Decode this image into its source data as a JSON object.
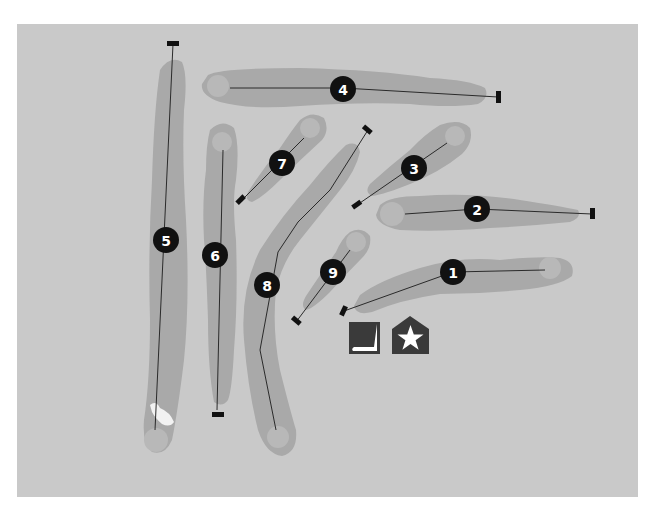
{
  "map": {
    "title": "Golf course layout",
    "colors": {
      "background": "#c9c9c9",
      "fairway": "#a9a9a9",
      "green": "#b8b8b8",
      "marker": "#111111",
      "icon": "#3a3a3a"
    }
  },
  "holes": [
    {
      "number": "1"
    },
    {
      "number": "2"
    },
    {
      "number": "3"
    },
    {
      "number": "4"
    },
    {
      "number": "5"
    },
    {
      "number": "6"
    },
    {
      "number": "7"
    },
    {
      "number": "8"
    },
    {
      "number": "9"
    }
  ],
  "legend": {
    "practice_green_icon": "putter-icon",
    "clubhouse_icon": "clubhouse-star-icon"
  }
}
